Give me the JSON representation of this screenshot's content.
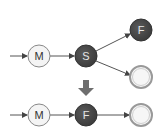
{
  "diagram": {
    "top_row": {
      "nodes": [
        {
          "id": "m1",
          "label": "M",
          "style": "light"
        },
        {
          "id": "s",
          "label": "S",
          "style": "dark"
        },
        {
          "id": "f1",
          "label": "F",
          "style": "dark"
        },
        {
          "id": "e1",
          "label": "",
          "style": "double-ring"
        }
      ],
      "edges": [
        {
          "from": "start",
          "to": "m1"
        },
        {
          "from": "m1",
          "to": "s"
        },
        {
          "from": "s",
          "to": "f1"
        },
        {
          "from": "s",
          "to": "e1"
        }
      ]
    },
    "transition_arrow": "down-arrow",
    "bottom_row": {
      "nodes": [
        {
          "id": "m2",
          "label": "M",
          "style": "light"
        },
        {
          "id": "f2",
          "label": "F",
          "style": "dark"
        },
        {
          "id": "e2",
          "label": "",
          "style": "double-ring"
        }
      ],
      "edges": [
        {
          "from": "start",
          "to": "m2"
        },
        {
          "from": "m2",
          "to": "f2"
        },
        {
          "from": "f2",
          "to": "e2"
        }
      ]
    },
    "colors": {
      "dark_node": "#4a4a4a",
      "light_node": "#f4f4f4",
      "ring": "#9a9a9a",
      "edge": "#555555",
      "down_arrow": "#6e6e6e"
    }
  }
}
